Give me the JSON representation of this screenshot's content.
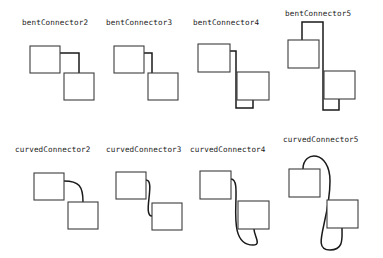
{
  "figure": {
    "background_color": "#ffffff",
    "box_stroke_color": "#3c3c3c",
    "connector_stroke_color": "#1a1a1a",
    "label_color": "#1a1a1a",
    "box_width": 30,
    "box_height": 27,
    "rows": 2,
    "columns": 4
  },
  "panels": [
    {
      "id": "bentConnector2",
      "label": "bentConnector2",
      "label_x": 22,
      "label_y": 19,
      "kind": "bent",
      "start_box": {
        "x": 30,
        "y": 46,
        "w": 30,
        "h": 27
      },
      "end_box": {
        "x": 64,
        "y": 73,
        "w": 30,
        "h": 27
      },
      "path": "M 60 53 L 79 53 L 79 73",
      "segments": 2,
      "start_side": "right",
      "end_side": "top"
    },
    {
      "id": "bentConnector3",
      "label": "bentConnector3",
      "label_x": 106,
      "label_y": 19,
      "kind": "bent",
      "start_box": {
        "x": 114,
        "y": 46,
        "w": 30,
        "h": 27
      },
      "end_box": {
        "x": 148,
        "y": 73,
        "w": 30,
        "h": 27
      },
      "path": "M 144 53 L 152 53 L 152 88 L 148 88",
      "segments": 3,
      "start_side": "right",
      "end_side": "left"
    },
    {
      "id": "bentConnector4",
      "label": "bentConnector4",
      "label_x": 193,
      "label_y": 19,
      "kind": "bent",
      "start_box": {
        "x": 198,
        "y": 44,
        "w": 32,
        "h": 28
      },
      "end_box": {
        "x": 237,
        "y": 72,
        "w": 32,
        "h": 28
      },
      "path": "M 230 51 L 236 51 L 236 108 L 253 108 L 253 100",
      "segments": 4,
      "start_side": "right",
      "end_side": "bottom"
    },
    {
      "id": "bentConnector5",
      "label": "bentConnector5",
      "label_x": 285,
      "label_y": 10,
      "kind": "bent",
      "start_box": {
        "x": 288,
        "y": 40,
        "w": 31,
        "h": 28
      },
      "end_box": {
        "x": 324,
        "y": 71,
        "w": 31,
        "h": 28
      },
      "path": "M 302 40 L 302 22 L 323 22 L 323 110 L 339 110 L 339 99",
      "segments": 5,
      "start_side": "top",
      "end_side": "bottom"
    },
    {
      "id": "curvedConnector2",
      "label": "curvedConnector2",
      "label_x": 15,
      "label_y": 146,
      "kind": "curved",
      "start_box": {
        "x": 34,
        "y": 173,
        "w": 30,
        "h": 27
      },
      "end_box": {
        "x": 68,
        "y": 202,
        "w": 30,
        "h": 27
      },
      "path": "M 64 181 C 79 181 83 186 83 202",
      "start_side": "right",
      "end_side": "top"
    },
    {
      "id": "curvedConnector3",
      "label": "curvedConnector3",
      "label_x": 106,
      "label_y": 146,
      "kind": "curved",
      "start_box": {
        "x": 116,
        "y": 172,
        "w": 30,
        "h": 27
      },
      "end_box": {
        "x": 152,
        "y": 203,
        "w": 30,
        "h": 27
      },
      "path": "M 146 180 C 156 180 142 216 152 216",
      "start_side": "right",
      "end_side": "left"
    },
    {
      "id": "curvedConnector4",
      "label": "curvedConnector4",
      "label_x": 190,
      "label_y": 146,
      "kind": "curved",
      "start_box": {
        "x": 200,
        "y": 171,
        "w": 31,
        "h": 28
      },
      "end_box": {
        "x": 238,
        "y": 201,
        "w": 31,
        "h": 28
      },
      "path": "M 231 179 C 245 179 222 245 253 245 C 262 245 254 236 254 229",
      "start_side": "right",
      "end_side": "bottom"
    },
    {
      "id": "curvedConnector5",
      "label": "curvedConnector5",
      "label_x": 283,
      "label_y": 136,
      "kind": "curved",
      "start_box": {
        "x": 289,
        "y": 169,
        "w": 31,
        "h": 28
      },
      "end_box": {
        "x": 327,
        "y": 200,
        "w": 31,
        "h": 28
      },
      "path": "M 303 169 C 303 150 330 150 330 181 C 330 222 310 250 330 250 C 344 250 342 238 342 228",
      "start_side": "top",
      "end_side": "bottom"
    }
  ]
}
